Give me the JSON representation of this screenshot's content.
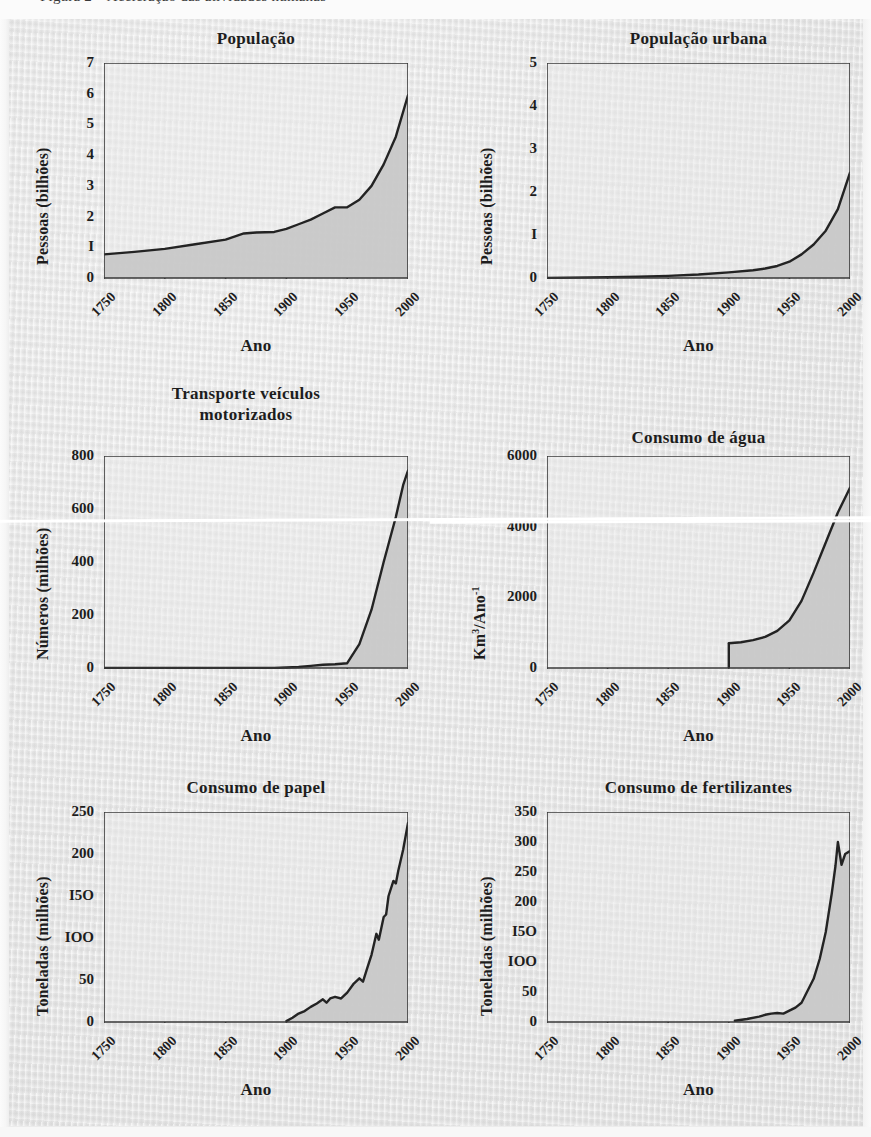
{
  "page": {
    "caption_fragment": "Figura 2 – Aceleração das atividades humanas",
    "background_color": "#ececec",
    "ink_color": "#1d1d1d",
    "fill_color": "#c8c8c8",
    "plot_bg_color": "#eaeaea"
  },
  "common": {
    "xlabel": "Ano",
    "xticks": [
      "1750",
      "1800",
      "1850",
      "1900",
      "1950",
      "2000"
    ],
    "xlim": [
      1750,
      2000
    ]
  },
  "chart_data": [
    {
      "id": "populacao",
      "type": "area",
      "title": "População",
      "ylabel": "Pessoas (bilhões)",
      "xlabel": "Ano",
      "ylim": [
        0,
        7
      ],
      "yticks": [
        "0",
        "I",
        "2",
        "3",
        "4",
        "5",
        "6",
        "7"
      ],
      "ytick_values": [
        0,
        1,
        2,
        3,
        4,
        5,
        6,
        7
      ],
      "xlim": [
        1750,
        2000
      ],
      "xticks": [
        "1750",
        "1800",
        "1850",
        "1900",
        "1950",
        "2000"
      ],
      "grid": false,
      "legend": "none",
      "x": [
        1750,
        1775,
        1800,
        1825,
        1850,
        1865,
        1875,
        1890,
        1900,
        1910,
        1920,
        1930,
        1940,
        1950,
        1960,
        1970,
        1980,
        1990,
        2000
      ],
      "values": [
        0.77,
        0.85,
        0.95,
        1.1,
        1.25,
        1.45,
        1.48,
        1.5,
        1.6,
        1.75,
        1.9,
        2.1,
        2.3,
        2.3,
        2.55,
        3.0,
        3.7,
        4.6,
        5.95
      ]
    },
    {
      "id": "populacao-urbana",
      "type": "area",
      "title": "População urbana",
      "ylabel": "Pessoas (bilhões)",
      "xlabel": "Ano",
      "ylim": [
        0,
        5
      ],
      "yticks": [
        "0",
        "I",
        "2",
        "3",
        "4",
        "5"
      ],
      "ytick_values": [
        0,
        1,
        2,
        3,
        4,
        5
      ],
      "xlim": [
        1750,
        2000
      ],
      "xticks": [
        "1750",
        "1800",
        "1850",
        "1900",
        "1950",
        "2000"
      ],
      "grid": false,
      "legend": "none",
      "x": [
        1750,
        1800,
        1825,
        1850,
        1875,
        1900,
        1920,
        1930,
        1940,
        1950,
        1960,
        1970,
        1980,
        1990,
        2000
      ],
      "values": [
        0.0,
        0.02,
        0.03,
        0.05,
        0.08,
        0.13,
        0.18,
        0.22,
        0.28,
        0.38,
        0.55,
        0.78,
        1.1,
        1.6,
        2.45
      ]
    },
    {
      "id": "transporte-veiculos-motorizados",
      "type": "area",
      "title": "Transporte veículos\nmotorizados",
      "ylabel": "Números (milhões)",
      "xlabel": "Ano",
      "ylim": [
        0,
        800
      ],
      "yticks": [
        "0",
        "200",
        "400",
        "600",
        "800"
      ],
      "ytick_values": [
        0,
        200,
        400,
        600,
        800
      ],
      "xlim": [
        1750,
        2000
      ],
      "xticks": [
        "1750",
        "1800",
        "1850",
        "1900",
        "1950",
        "2000"
      ],
      "grid": false,
      "legend": "none",
      "x": [
        1750,
        1850,
        1890,
        1900,
        1910,
        1920,
        1930,
        1940,
        1950,
        1960,
        1970,
        1980,
        1990,
        1996,
        2000
      ],
      "values": [
        0,
        0,
        0,
        2,
        4,
        8,
        12,
        14,
        18,
        90,
        220,
        400,
        570,
        690,
        745
      ]
    },
    {
      "id": "consumo-de-agua",
      "type": "area",
      "title": "Consumo de água",
      "ylabel": "Km³/Ano⁻¹",
      "ylabel_html": "Km<sup>3</sup>/Ano<sup>-1</sup>",
      "xlabel": "Ano",
      "ylim": [
        0,
        6000
      ],
      "yticks": [
        "0",
        "2000",
        "4000",
        "6000"
      ],
      "ytick_values": [
        0,
        2000,
        4000,
        6000
      ],
      "xlim": [
        1750,
        2000
      ],
      "xticks": [
        "1750",
        "1800",
        "1850",
        "1900",
        "1950",
        "2000"
      ],
      "grid": false,
      "legend": "none",
      "data_start_year": 1900,
      "x": [
        1900,
        1910,
        1920,
        1930,
        1940,
        1950,
        1960,
        1970,
        1980,
        1990,
        2000
      ],
      "values": [
        700,
        730,
        790,
        880,
        1050,
        1350,
        1900,
        2700,
        3550,
        4400,
        5100
      ]
    },
    {
      "id": "consumo-de-papel",
      "type": "area",
      "title": "Consumo de papel",
      "ylabel": "Toneladas (milhões)",
      "xlabel": "Ano",
      "ylim": [
        0,
        250
      ],
      "yticks": [
        "0",
        "50",
        "IOO",
        "I5O",
        "200",
        "250"
      ],
      "ytick_values": [
        0,
        50,
        100,
        150,
        200,
        250
      ],
      "xlim": [
        1750,
        2000
      ],
      "xticks": [
        "1750",
        "1800",
        "1850",
        "1900",
        "1950",
        "2000"
      ],
      "grid": false,
      "legend": "none",
      "data_start_year": 1900,
      "x": [
        1900,
        1905,
        1910,
        1915,
        1920,
        1925,
        1930,
        1933,
        1936,
        1940,
        1945,
        1950,
        1955,
        1960,
        1963,
        1966,
        1970,
        1974,
        1976,
        1980,
        1982,
        1984,
        1988,
        1990,
        1992,
        1996,
        2000
      ],
      "values": [
        1,
        5,
        10,
        13,
        18,
        22,
        27,
        23,
        28,
        30,
        28,
        35,
        45,
        52,
        48,
        62,
        80,
        105,
        98,
        125,
        128,
        150,
        168,
        165,
        180,
        205,
        237
      ]
    },
    {
      "id": "consumo-de-fertilizantes",
      "type": "area",
      "title": "Consumo de fertilizantes",
      "ylabel": "Toneladas (milhões)",
      "xlabel": "Ano",
      "ylim": [
        0,
        350
      ],
      "yticks": [
        "0",
        "50",
        "IOO",
        "I5O",
        "200",
        "250",
        "300",
        "350"
      ],
      "ytick_values": [
        0,
        50,
        100,
        150,
        200,
        250,
        300,
        350
      ],
      "xlim": [
        1750,
        2000
      ],
      "xticks": [
        "1750",
        "1800",
        "1850",
        "1900",
        "1950",
        "2000"
      ],
      "grid": false,
      "legend": "none",
      "data_start_year": 1905,
      "x": [
        1905,
        1915,
        1925,
        1930,
        1935,
        1940,
        1945,
        1950,
        1955,
        1960,
        1965,
        1970,
        1975,
        1980,
        1985,
        1988,
        1990,
        1993,
        1996,
        2000
      ],
      "values": [
        2,
        5,
        9,
        12,
        14,
        15,
        14,
        19,
        24,
        32,
        52,
        72,
        105,
        150,
        215,
        260,
        300,
        262,
        280,
        285
      ]
    }
  ]
}
